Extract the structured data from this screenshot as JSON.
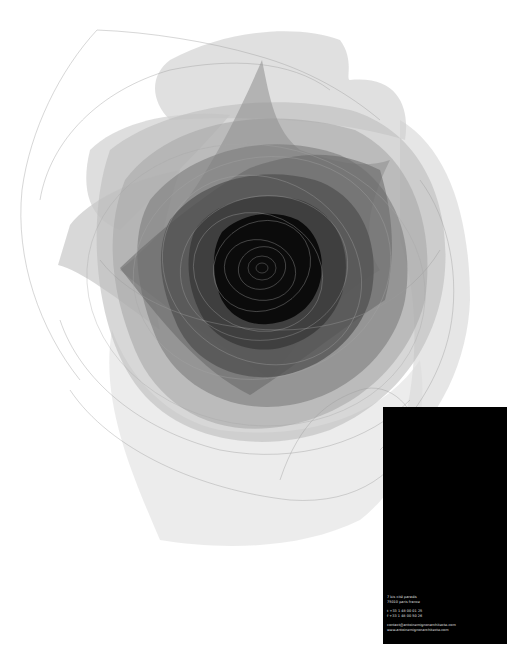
{
  "poster": {
    "background": "#ffffff",
    "artwork": {
      "subject": "rose-illustration",
      "style": "layered translucent grayscale petals with thin outline strokes",
      "center_color": "#000000",
      "petal_tones": [
        "#ececec",
        "#dcdcdc",
        "#c8c8c8",
        "#b4b4b4",
        "#9c9c9c",
        "#858585",
        "#6d6d6d",
        "#555555",
        "#3c3c3c",
        "#1e1e1e"
      ]
    },
    "card": {
      "background": "#000000",
      "text_color": "#e6e6e6",
      "address": {
        "line1": "7 bis cité paradis",
        "line2": "75010 paris  france"
      },
      "phone": {
        "tel": "t +33 1 48 00 01 25",
        "fax": "f +33 1 48 00 50 26"
      },
      "web": {
        "email": "contact@antoinemignonarchitecte.com",
        "site": "www.antoinemignonarchitecte.com"
      }
    }
  }
}
